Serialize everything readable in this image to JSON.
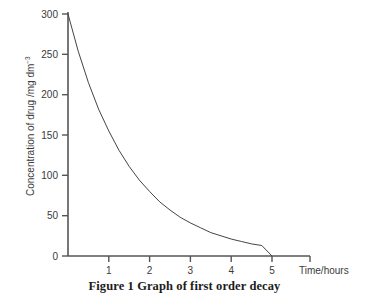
{
  "caption": "Figure 1 Graph of first order decay",
  "axes": {
    "y_title_main": "Concentration of drug /mg dm",
    "y_title_sup": "−3",
    "x_title": "Time/hours",
    "y_ticks": [
      "0",
      "50",
      "100",
      "150",
      "200",
      "250",
      "300"
    ],
    "x_ticks": [
      "1",
      "2",
      "3",
      "4",
      "5"
    ]
  },
  "colors": {
    "axis": "#555555",
    "curve": "#444444",
    "text": "#3a3a3a",
    "caption": "#1c1c1c",
    "background": "#ffffff"
  },
  "chart_data": {
    "type": "line",
    "title": "Figure 1 Graph of first order decay",
    "xlabel": "Time/hours",
    "ylabel": "Concentration of drug /mg dm−3",
    "xlim": [
      0,
      6
    ],
    "ylim": [
      0,
      300
    ],
    "grid": false,
    "legend": "none",
    "x_ticks": [
      1,
      2,
      3,
      4,
      5
    ],
    "y_ticks": [
      0,
      50,
      100,
      150,
      200,
      250,
      300
    ],
    "series": [
      {
        "name": "Concentration of drug",
        "x": [
          0,
          0.25,
          0.5,
          0.75,
          1,
          1.25,
          1.5,
          1.75,
          2,
          2.25,
          2.5,
          2.75,
          3,
          3.25,
          3.5,
          3.75,
          4,
          4.25,
          4.5,
          4.75,
          5
        ],
        "values": [
          300,
          254,
          215,
          182,
          155,
          131,
          111,
          94,
          80,
          67,
          57,
          48,
          41,
          35,
          29,
          25,
          21,
          18,
          15,
          13,
          0
        ]
      }
    ],
    "annotations": []
  }
}
